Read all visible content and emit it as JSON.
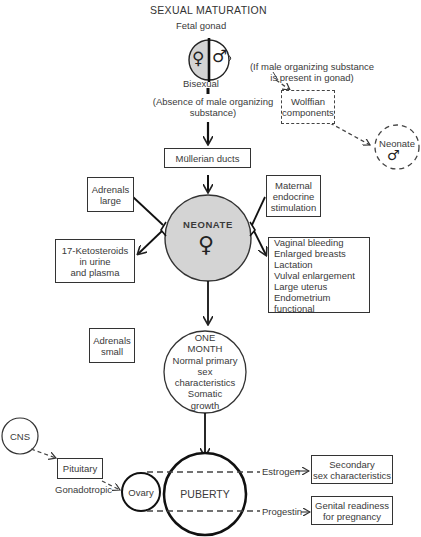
{
  "title": "SEXUAL MATURATION",
  "fetal_gonad": {
    "label": "Fetal gonad",
    "female_symbol": "♀",
    "male_symbol": "♂",
    "below_label": "Bisexual"
  },
  "condition_female": {
    "line1": "(Absence of male organizing",
    "line2": "substance)"
  },
  "condition_male": {
    "line1": "(If male organizing substance",
    "line2": "is present in gonad)"
  },
  "wolffian": {
    "line1": "Wolffian",
    "line2": "components"
  },
  "male_neonate": {
    "label": "Neonate",
    "symbol": "♂"
  },
  "mullerian": {
    "label": "Müllerian ducts"
  },
  "adrenals_large": {
    "line1": "Adrenals",
    "line2": "large"
  },
  "ketosteroids": {
    "line1": "17-Ketosteroids",
    "line2": "in urine",
    "line3": "and plasma"
  },
  "maternal": {
    "line1": "Maternal",
    "line2": "endocrine",
    "line3": "stimulation"
  },
  "neonate": {
    "label": "NEONATE",
    "symbol": "♀"
  },
  "neonate_effects": {
    "items": [
      "Vaginal bleeding",
      "Enlarged breasts",
      "Lactation",
      "Vulval enlargement",
      "Large uterus",
      "Endometrium functional"
    ]
  },
  "adrenals_small": {
    "line1": "Adrenals",
    "line2": "small"
  },
  "one_month": {
    "line1": "ONE",
    "line2": "MONTH",
    "line3": "Normal primary",
    "line4": "sex",
    "line5": "characteristics",
    "line6": "Somatic",
    "line7": "growth"
  },
  "cns": {
    "label": "CNS"
  },
  "pituitary": {
    "label": "Pituitary",
    "sublabel": "Gonadotropic"
  },
  "ovary": {
    "label": "Ovary"
  },
  "puberty": {
    "label": "PUBERTY"
  },
  "estrogen": {
    "label": "Estrogen"
  },
  "progestin": {
    "label": "Progestin"
  },
  "secondary": {
    "line1": "Secondary",
    "line2": "sex characteristics"
  },
  "genital": {
    "line1": "Genital readiness",
    "line2": "for pregnancy"
  },
  "colors": {
    "neonate_fill": "#d4d4d4",
    "line": "#222222",
    "text": "#3a3a3a"
  }
}
